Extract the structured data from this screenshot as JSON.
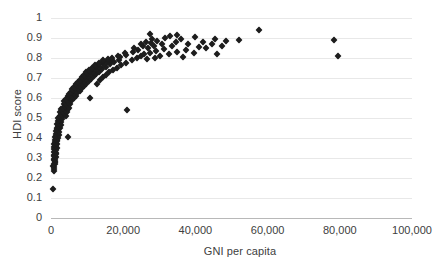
{
  "chart_data": {
    "type": "scatter",
    "title": "",
    "xlabel": "GNI per capita",
    "ylabel": "HDI score",
    "xlim": [
      0,
      100000
    ],
    "ylim": [
      0,
      1
    ],
    "grid": true,
    "legend": "none",
    "marker_style": "diamond",
    "marker_color": "#1d1d1d",
    "xticks": [
      0,
      20000,
      40000,
      60000,
      80000,
      100000
    ],
    "xtick_labels": [
      "0",
      "20,000",
      "40,000",
      "60,000",
      "80,000",
      "100,000"
    ],
    "yticks": [
      0,
      0.1,
      0.2,
      0.3,
      0.4,
      0.5,
      0.6,
      0.7,
      0.8,
      0.9,
      1
    ],
    "ytick_labels": [
      "0",
      "0.1",
      "0.2",
      "0.3",
      "0.4",
      "0.5",
      "0.6",
      "0.7",
      "0.8",
      "0.9",
      "1"
    ],
    "points": [
      [
        680,
        0.145
      ],
      [
        760,
        0.235
      ],
      [
        820,
        0.245
      ],
      [
        900,
        0.255
      ],
      [
        640,
        0.262
      ],
      [
        1050,
        0.268
      ],
      [
        870,
        0.272
      ],
      [
        980,
        0.278
      ],
      [
        1120,
        0.282
      ],
      [
        750,
        0.288
      ],
      [
        1240,
        0.292
      ],
      [
        900,
        0.296
      ],
      [
        1050,
        0.3
      ],
      [
        1380,
        0.304
      ],
      [
        820,
        0.308
      ],
      [
        1150,
        0.312
      ],
      [
        960,
        0.316
      ],
      [
        1300,
        0.32
      ],
      [
        1480,
        0.324
      ],
      [
        880,
        0.328
      ],
      [
        1180,
        0.332
      ],
      [
        1020,
        0.336
      ],
      [
        1420,
        0.34
      ],
      [
        760,
        0.344
      ],
      [
        1260,
        0.348
      ],
      [
        1560,
        0.352
      ],
      [
        940,
        0.356
      ],
      [
        1340,
        0.36
      ],
      [
        1100,
        0.364
      ],
      [
        1680,
        0.368
      ],
      [
        860,
        0.372
      ],
      [
        1480,
        0.376
      ],
      [
        1220,
        0.38
      ],
      [
        1780,
        0.384
      ],
      [
        1020,
        0.388
      ],
      [
        1600,
        0.392
      ],
      [
        1360,
        0.396
      ],
      [
        1920,
        0.4
      ],
      [
        1140,
        0.404
      ],
      [
        1720,
        0.408
      ],
      [
        4800,
        0.404
      ],
      [
        1480,
        0.412
      ],
      [
        2100,
        0.416
      ],
      [
        1280,
        0.42
      ],
      [
        1860,
        0.424
      ],
      [
        1600,
        0.428
      ],
      [
        2280,
        0.432
      ],
      [
        1420,
        0.436
      ],
      [
        2000,
        0.44
      ],
      [
        1740,
        0.444
      ],
      [
        2460,
        0.448
      ],
      [
        1560,
        0.452
      ],
      [
        2180,
        0.456
      ],
      [
        1900,
        0.46
      ],
      [
        2640,
        0.464
      ],
      [
        1700,
        0.468
      ],
      [
        2360,
        0.472
      ],
      [
        2080,
        0.476
      ],
      [
        2840,
        0.48
      ],
      [
        1840,
        0.484
      ],
      [
        2540,
        0.488
      ],
      [
        2260,
        0.492
      ],
      [
        3020,
        0.496
      ],
      [
        2000,
        0.5
      ],
      [
        2700,
        0.504
      ],
      [
        3400,
        0.508
      ],
      [
        2440,
        0.512
      ],
      [
        3180,
        0.516
      ],
      [
        4100,
        0.512
      ],
      [
        2880,
        0.52
      ],
      [
        3620,
        0.524
      ],
      [
        2620,
        0.528
      ],
      [
        3360,
        0.532
      ],
      [
        4400,
        0.528
      ],
      [
        3080,
        0.536
      ],
      [
        3840,
        0.54
      ],
      [
        2820,
        0.544
      ],
      [
        3560,
        0.548
      ],
      [
        4700,
        0.544
      ],
      [
        3300,
        0.552
      ],
      [
        4080,
        0.556
      ],
      [
        5000,
        0.552
      ],
      [
        3780,
        0.56
      ],
      [
        4500,
        0.564
      ],
      [
        3500,
        0.568
      ],
      [
        4280,
        0.572
      ],
      [
        5400,
        0.568
      ],
      [
        4000,
        0.576
      ],
      [
        4800,
        0.58
      ],
      [
        3720,
        0.584
      ],
      [
        5100,
        0.588
      ],
      [
        4400,
        0.592
      ],
      [
        5800,
        0.588
      ],
      [
        4200,
        0.596
      ],
      [
        5500,
        0.6
      ],
      [
        4900,
        0.604
      ],
      [
        6300,
        0.6
      ],
      [
        10800,
        0.598
      ],
      [
        4650,
        0.608
      ],
      [
        5900,
        0.612
      ],
      [
        5300,
        0.616
      ],
      [
        6800,
        0.612
      ],
      [
        5100,
        0.62
      ],
      [
        6400,
        0.624
      ],
      [
        5700,
        0.628
      ],
      [
        7300,
        0.624
      ],
      [
        5500,
        0.632
      ],
      [
        6900,
        0.636
      ],
      [
        6200,
        0.64
      ],
      [
        7900,
        0.636
      ],
      [
        5950,
        0.644
      ],
      [
        7400,
        0.648
      ],
      [
        6700,
        0.652
      ],
      [
        8500,
        0.648
      ],
      [
        6400,
        0.656
      ],
      [
        7950,
        0.66
      ],
      [
        7200,
        0.664
      ],
      [
        9100,
        0.66
      ],
      [
        6900,
        0.668
      ],
      [
        8500,
        0.672
      ],
      [
        12800,
        0.668
      ],
      [
        7700,
        0.676
      ],
      [
        9700,
        0.672
      ],
      [
        7400,
        0.68
      ],
      [
        9050,
        0.684
      ],
      [
        8250,
        0.688
      ],
      [
        10400,
        0.684
      ],
      [
        7950,
        0.692
      ],
      [
        9600,
        0.696
      ],
      [
        8800,
        0.7
      ],
      [
        11100,
        0.696
      ],
      [
        13500,
        0.692
      ],
      [
        8500,
        0.704
      ],
      [
        10200,
        0.708
      ],
      [
        9400,
        0.712
      ],
      [
        11800,
        0.708
      ],
      [
        14400,
        0.704
      ],
      [
        9100,
        0.716
      ],
      [
        10900,
        0.72
      ],
      [
        10000,
        0.724
      ],
      [
        12500,
        0.72
      ],
      [
        15300,
        0.716
      ],
      [
        9800,
        0.728
      ],
      [
        11600,
        0.732
      ],
      [
        10700,
        0.736
      ],
      [
        13300,
        0.732
      ],
      [
        16200,
        0.728
      ],
      [
        10500,
        0.74
      ],
      [
        12400,
        0.744
      ],
      [
        11500,
        0.748
      ],
      [
        14200,
        0.744
      ],
      [
        17200,
        0.74
      ],
      [
        11300,
        0.752
      ],
      [
        13300,
        0.756
      ],
      [
        12400,
        0.76
      ],
      [
        15200,
        0.756
      ],
      [
        18300,
        0.752
      ],
      [
        12200,
        0.764
      ],
      [
        14300,
        0.768
      ],
      [
        13400,
        0.772
      ],
      [
        16300,
        0.768
      ],
      [
        19500,
        0.764
      ],
      [
        13200,
        0.776
      ],
      [
        15400,
        0.78
      ],
      [
        14500,
        0.784
      ],
      [
        17500,
        0.78
      ],
      [
        20800,
        0.776
      ],
      [
        21000,
        0.54
      ],
      [
        14300,
        0.788
      ],
      [
        16700,
        0.792
      ],
      [
        15700,
        0.796
      ],
      [
        18900,
        0.792
      ],
      [
        22300,
        0.788
      ],
      [
        16900,
        0.8
      ],
      [
        19100,
        0.804
      ],
      [
        23800,
        0.798
      ],
      [
        26500,
        0.794
      ],
      [
        18500,
        0.81
      ],
      [
        20800,
        0.814
      ],
      [
        24900,
        0.808
      ],
      [
        28800,
        0.802
      ],
      [
        25800,
        0.818
      ],
      [
        30200,
        0.812
      ],
      [
        36500,
        0.806
      ],
      [
        46000,
        0.82
      ],
      [
        20500,
        0.826
      ],
      [
        22800,
        0.83
      ],
      [
        27500,
        0.824
      ],
      [
        32600,
        0.82
      ],
      [
        24200,
        0.838
      ],
      [
        29000,
        0.834
      ],
      [
        35000,
        0.83
      ],
      [
        39500,
        0.826
      ],
      [
        23000,
        0.848
      ],
      [
        26800,
        0.85
      ],
      [
        31200,
        0.846
      ],
      [
        37500,
        0.842
      ],
      [
        43000,
        0.848
      ],
      [
        25500,
        0.858
      ],
      [
        28500,
        0.862
      ],
      [
        33500,
        0.858
      ],
      [
        41000,
        0.856
      ],
      [
        47500,
        0.862
      ],
      [
        24800,
        0.872
      ],
      [
        27800,
        0.874
      ],
      [
        30800,
        0.87
      ],
      [
        38000,
        0.868
      ],
      [
        44500,
        0.872
      ],
      [
        26200,
        0.882
      ],
      [
        29500,
        0.886
      ],
      [
        34500,
        0.882
      ],
      [
        42000,
        0.88
      ],
      [
        48500,
        0.884
      ],
      [
        78500,
        0.892
      ],
      [
        28000,
        0.896
      ],
      [
        31500,
        0.898
      ],
      [
        36000,
        0.894
      ],
      [
        45500,
        0.896
      ],
      [
        52000,
        0.89
      ],
      [
        33000,
        0.908
      ],
      [
        40000,
        0.904
      ],
      [
        27500,
        0.918
      ],
      [
        34800,
        0.916
      ],
      [
        57500,
        0.938
      ],
      [
        79500,
        0.812
      ]
    ]
  },
  "axes": {
    "y_title": "HDI score",
    "x_title": "GNI per capita"
  }
}
